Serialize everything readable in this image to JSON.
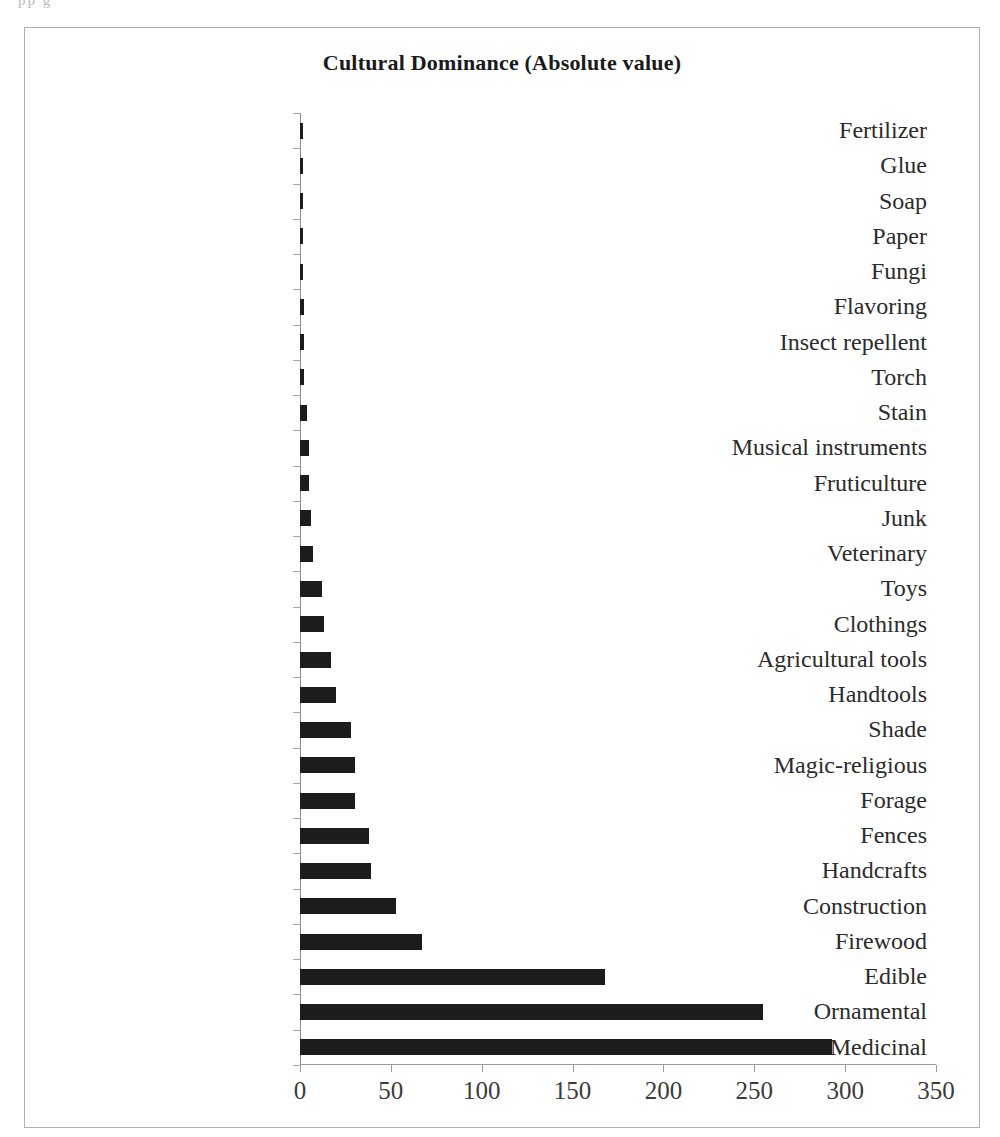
{
  "page": {
    "scan_artifact_text": "pp    g",
    "background_color": "#ffffff",
    "frame_border_color": "#b0b0b0"
  },
  "chart_data": {
    "type": "bar",
    "orientation": "horizontal",
    "title": "Cultural Dominance  (Absolute value)",
    "xlabel": "",
    "ylabel": "",
    "xlim": [
      0,
      350
    ],
    "xticks": [
      0,
      50,
      100,
      150,
      200,
      250,
      300,
      350
    ],
    "xtick_labels": [
      "0",
      "50",
      "100",
      "150",
      "200",
      "250",
      "300",
      "350"
    ],
    "grid": false,
    "legend": false,
    "bar_color": "#1c1c1c",
    "categories": [
      "Fertilizer",
      "Glue",
      "Soap",
      "Paper",
      "Fungi",
      "Flavoring",
      "Insect repellent",
      "Torch",
      "Stain",
      "Musical instruments",
      "Fruticulture",
      "Junk",
      "Veterinary",
      "Toys",
      "Clothings",
      "Agricultural tools",
      "Handtools",
      "Shade",
      "Magic-religious",
      "Forage",
      "Fences",
      "Handcrafts",
      "Construction",
      "Firewood",
      "Edible",
      "Ornamental",
      "Medicinal"
    ],
    "values": [
      1,
      1,
      1,
      1,
      1,
      2,
      2,
      2,
      4,
      5,
      5,
      6,
      7,
      12,
      13,
      17,
      20,
      28,
      30,
      30,
      38,
      39,
      53,
      67,
      168,
      255,
      293
    ]
  }
}
